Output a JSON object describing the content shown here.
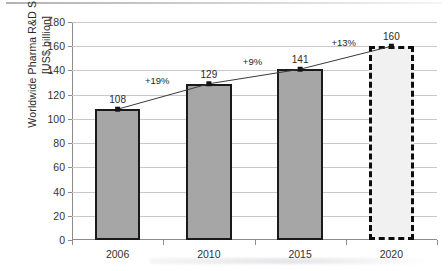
{
  "chart_data": {
    "type": "bar",
    "title": "",
    "xlabel": "",
    "ylabel": "Worldwide Pharma R&D Spending [US$ billion]",
    "ylabel_line1": "Worldwide Pharma R&D Spending",
    "ylabel_line2": "[US$ billion]",
    "categories": [
      "2006",
      "2010",
      "2015",
      "2020"
    ],
    "values": [
      108,
      129,
      141,
      160
    ],
    "value_labels": [
      "108",
      "129",
      "141",
      "160"
    ],
    "ylim": [
      0,
      180
    ],
    "ytick_step": 20,
    "ytick_labels": [
      "0",
      "20",
      "40",
      "60",
      "80",
      "100",
      "120",
      "140",
      "160",
      "180"
    ],
    "grid": true,
    "legend": "none",
    "bar_styles": [
      "solid",
      "solid",
      "solid",
      "dashed-forecast"
    ],
    "series_overlay": {
      "type": "line",
      "name": "trend",
      "markers": "square",
      "values": [
        108,
        129,
        141,
        160
      ]
    },
    "annotations": [
      {
        "label": "+19%",
        "from": "2006",
        "to": "2010"
      },
      {
        "label": "+9%",
        "from": "2010",
        "to": "2015"
      },
      {
        "label": "+13%",
        "from": "2015",
        "to": "2020"
      }
    ],
    "colors": {
      "bar_fill": "#a6a6a6",
      "bar_border": "#1a1a1a",
      "forecast_fill": "#f1f1f1",
      "forecast_border": "#0d0d0d",
      "gridline": "#c9c9c9",
      "axis": "#8c8c8c",
      "text": "#2b2b2b"
    }
  }
}
